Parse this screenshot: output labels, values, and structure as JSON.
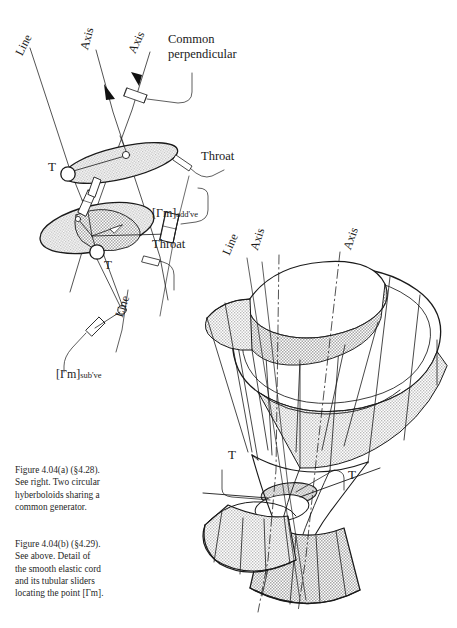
{
  "figure": {
    "background": "#ffffff",
    "ink": "#1a1a1a",
    "shade": "#d8d8d8"
  },
  "detail_figure": {
    "name": "Figure 4.04(b) detail",
    "labels": {
      "line_left": "Line",
      "axis_left": "Axis",
      "axis_right": "Axis",
      "common_perpendicular": "Common\nperpendicular",
      "throat_upper": "Throat",
      "throat_lower": "Throat",
      "t_upper": "T",
      "t_lower": "T",
      "gm_addve": "[Γm]",
      "gm_addve_sub": "add've",
      "gm_subve": "[Γm]",
      "gm_subve_sub": "sub've",
      "line_lower": "Line"
    }
  },
  "hyperboloid_figure": {
    "name": "Figure 4.04(a) two hyperboloids",
    "labels": {
      "line": "Line",
      "axis_left": "Axis",
      "axis_right": "Axis",
      "t_left": "T",
      "t_right": "T"
    }
  },
  "captions": {
    "a": "Figure 4.04(a) (§4.28).\nSee right. Two circular\nhyberboloids sharing a\ncommon generator.",
    "b": "Figure 4.04(b) (§4.29).\nSee above. Detail of\nthe smooth elastic cord\nand its tubular sliders\nlocating the point [Γm]."
  }
}
